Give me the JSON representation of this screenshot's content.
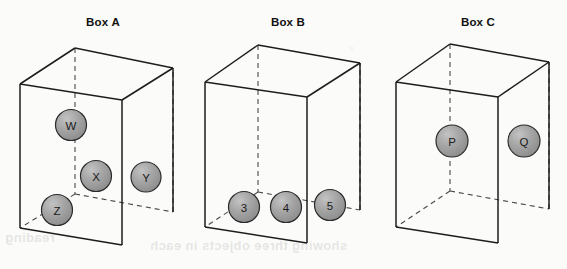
{
  "figure": {
    "name": "three-boxes-with-spheres-diagram",
    "background_color": "#fbfbf9",
    "edge_color": "#1d1d1d",
    "hidden_edge_color": "#4a4a4a",
    "sphere_fill_color": "#9a9a9a",
    "sphere_outline_color": "#2b2b2b",
    "label_color": "#1a1a1a"
  },
  "boxes": [
    {
      "id": "box-a",
      "title": "Box A",
      "title_x": 103,
      "title_y": 26,
      "geometry": {
        "front_top_left": [
          20,
          84
        ],
        "front_top_right": [
          122,
          100
        ],
        "front_bottom_left": [
          20,
          228
        ],
        "front_bottom_right": [
          122,
          245
        ],
        "back_top_left": [
          75,
          48
        ],
        "back_top_right": [
          173,
          68
        ],
        "back_bottom_left": [
          75,
          194
        ],
        "back_bottom_right": [
          173,
          212
        ]
      },
      "spheres": [
        {
          "label": "W",
          "cx": 71,
          "cy": 125,
          "r": 15.5
        },
        {
          "label": "X",
          "cx": 96,
          "cy": 176,
          "r": 15.5
        },
        {
          "label": "Y",
          "cx": 146,
          "cy": 177,
          "r": 15.0
        },
        {
          "label": "Z",
          "cx": 57,
          "cy": 210,
          "r": 15.5
        }
      ]
    },
    {
      "id": "box-b",
      "title": "Box B",
      "title_x": 288,
      "title_y": 26,
      "geometry": {
        "front_top_left": [
          205,
          82
        ],
        "front_top_right": [
          307,
          97
        ],
        "front_bottom_left": [
          205,
          227
        ],
        "front_bottom_right": [
          307,
          243
        ],
        "back_top_left": [
          258,
          45
        ],
        "back_top_right": [
          360,
          63
        ],
        "back_bottom_left": [
          258,
          192
        ],
        "back_bottom_right": [
          360,
          210
        ]
      },
      "spheres": [
        {
          "label": "3",
          "cx": 244,
          "cy": 207,
          "r": 15.5
        },
        {
          "label": "4",
          "cx": 286,
          "cy": 207,
          "r": 15.5
        },
        {
          "label": "5",
          "cx": 330,
          "cy": 205,
          "r": 15.5
        }
      ]
    },
    {
      "id": "box-c",
      "title": "Box C",
      "title_x": 478,
      "title_y": 26,
      "geometry": {
        "front_top_left": [
          396,
          82
        ],
        "front_top_right": [
          498,
          97
        ],
        "front_bottom_left": [
          396,
          227
        ],
        "front_bottom_right": [
          498,
          243
        ],
        "back_top_left": [
          450,
          44
        ],
        "back_top_right": [
          549,
          62
        ],
        "back_bottom_left": [
          450,
          191
        ],
        "back_bottom_right": [
          549,
          209
        ]
      },
      "spheres": [
        {
          "label": "P",
          "cx": 452,
          "cy": 141,
          "r": 16.0
        },
        {
          "label": "Q",
          "cx": 524,
          "cy": 141,
          "r": 16.0
        }
      ]
    }
  ],
  "background_show_through": [
    {
      "text": "showing three objects in each",
      "x": 150,
      "y": 238
    },
    {
      "text": "reading",
      "x": 5,
      "y": 230
    }
  ]
}
